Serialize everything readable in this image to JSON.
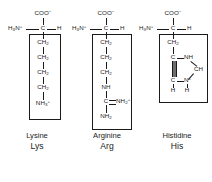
{
  "figure": {
    "background_color": "#ffffff",
    "ink_color": "#1a1a1a"
  },
  "amino_acids": [
    {
      "id": "lysine",
      "name_full": "Lysine",
      "name_abbr": "Lys",
      "backbone": {
        "amino_group": "H3N+",
        "alpha_carbon": "C",
        "alpha_hydrogen": "H",
        "carboxylate": "COO-"
      },
      "side_chain": [
        "CH2",
        "CH2",
        "CH2",
        "CH2",
        "NH3+"
      ],
      "side_chain_boxed": true
    },
    {
      "id": "arginine",
      "name_full": "Arginine",
      "name_abbr": "Arg",
      "backbone": {
        "amino_group": "H3N+",
        "alpha_carbon": "C",
        "alpha_hydrogen": "H",
        "carboxylate": "COO-"
      },
      "side_chain": [
        "CH2",
        "CH2",
        "CH2",
        "NH",
        "C",
        "NH2+",
        "NH2"
      ],
      "guanidinium": {
        "carbon": "C",
        "double_bonded_group": "NH2+",
        "terminal_group": "NH2"
      },
      "side_chain_boxed": true
    },
    {
      "id": "histidine",
      "name_full": "Histidine",
      "name_abbr": "His",
      "backbone": {
        "amino_group": "H3N+",
        "alpha_carbon": "C",
        "alpha_hydrogen": "H",
        "carboxylate": "COO-"
      },
      "side_chain": [
        "CH2"
      ],
      "imidazolium_ring": {
        "c_gamma": "C",
        "n_delta_h": "NH",
        "c_epsilon_h": "CH",
        "n_epsilon_plus": "N+",
        "n_epsilon_h": "H",
        "c_delta": "C",
        "c_delta_h": "H"
      },
      "side_chain_boxed": true
    }
  ],
  "glyphs": {
    "ch2": "CH",
    "ch2_sub": "2",
    "nh3_plus_base": "NH",
    "nh3_plus_sub": "3",
    "plus": "+",
    "minus": "−",
    "coo": "COO",
    "c": "C",
    "h": "H",
    "nh": "NH",
    "nh2": "NH",
    "nh2_sub": "2",
    "h3n": "H",
    "h3n_sub": "3",
    "h3n_n": "N",
    "ch": "CH",
    "n": "N"
  }
}
